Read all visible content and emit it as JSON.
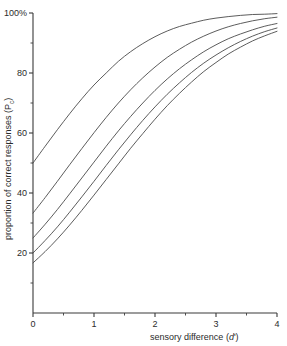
{
  "chart_data": {
    "type": "line",
    "title": "",
    "xlabel": "sensory difference (d')",
    "ylabel": "proportion of correct responses (Pc)",
    "xlim": [
      0,
      4
    ],
    "ylim": [
      0,
      100
    ],
    "grid": false,
    "legend_position": "none",
    "x_ticks": [
      "0",
      "1",
      "2",
      "3",
      "4"
    ],
    "x_tick_values": [
      0,
      1,
      2,
      3,
      4
    ],
    "x_minor_tick_values": [
      0.5,
      1.5,
      2.5,
      3.5
    ],
    "y_ticks": [
      "20",
      "40",
      "60",
      "80",
      "100%"
    ],
    "y_tick_values": [
      20,
      40,
      60,
      80,
      100
    ],
    "y_minor_tick_values": [
      10,
      30,
      50,
      70,
      90
    ],
    "x": [
      0,
      0.2,
      0.4,
      0.6,
      0.8,
      1.0,
      1.2,
      1.4,
      1.6,
      1.8,
      2.0,
      2.2,
      2.4,
      2.6,
      2.8,
      3.0,
      3.2,
      3.4,
      3.6,
      3.8,
      4.0
    ],
    "series": [
      {
        "name": "2-AFC",
        "values": [
          50.0,
          55.6,
          61.1,
          66.4,
          71.4,
          76.0,
          80.0,
          83.9,
          87.1,
          89.8,
          92.1,
          94.0,
          95.5,
          96.6,
          97.6,
          98.3,
          98.8,
          99.2,
          99.5,
          99.6,
          99.8
        ]
      },
      {
        "name": "3-AFC",
        "values": [
          33.3,
          38.5,
          43.9,
          49.4,
          54.8,
          60.1,
          65.2,
          70.0,
          74.4,
          78.4,
          82.0,
          85.2,
          87.9,
          90.3,
          92.3,
          94.0,
          95.4,
          96.5,
          97.4,
          98.1,
          98.6
        ]
      },
      {
        "name": "4-AFC",
        "values": [
          25.0,
          29.6,
          34.5,
          39.7,
          45.0,
          50.3,
          55.6,
          60.7,
          65.5,
          70.0,
          74.2,
          78.0,
          81.4,
          84.4,
          87.1,
          89.4,
          91.4,
          93.0,
          94.4,
          95.6,
          96.5
        ]
      },
      {
        "name": "5-AFC",
        "values": [
          20.0,
          24.2,
          28.7,
          33.6,
          38.7,
          43.9,
          49.2,
          54.4,
          59.4,
          64.2,
          68.7,
          72.9,
          76.7,
          80.2,
          83.3,
          86.0,
          88.4,
          90.5,
          92.3,
          93.8,
          95.0
        ]
      },
      {
        "name": "6-AFC",
        "values": [
          16.7,
          20.5,
          24.7,
          29.3,
          34.2,
          39.3,
          44.5,
          49.7,
          54.9,
          59.8,
          64.6,
          69.1,
          73.2,
          77.0,
          80.5,
          83.5,
          86.3,
          88.6,
          90.7,
          92.4,
          93.9
        ]
      }
    ]
  },
  "axes": {
    "y_title_main": "proportion of correct responses (P",
    "y_title_sub": "c",
    "y_title_close": ")",
    "x_title_main": "sensory  difference (",
    "x_title_italic": "d",
    "x_title_prime": "'",
    "x_title_close": ")"
  }
}
